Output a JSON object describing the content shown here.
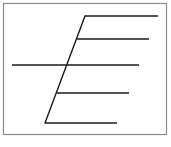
{
  "diagram": {
    "frame": {
      "x": 3.5,
      "y": 3.5,
      "width": 163,
      "height": 131,
      "stroke": "#8a8a8a",
      "stroke_width": 1.2
    },
    "stroke_color": "#1a1a1a",
    "stroke_width": 1.4,
    "spine": {
      "x1": 85,
      "y1": 16,
      "x2": 45,
      "y2": 123
    },
    "lines": [
      {
        "x1": 85,
        "y1": 16,
        "x2": 158,
        "y2": 16
      },
      {
        "x1": 77,
        "y1": 39,
        "x2": 149,
        "y2": 39
      },
      {
        "x1": 12,
        "y1": 65,
        "x2": 139,
        "y2": 65
      },
      {
        "x1": 57,
        "y1": 93,
        "x2": 129,
        "y2": 93
      },
      {
        "x1": 45,
        "y1": 123,
        "x2": 117,
        "y2": 123
      }
    ]
  }
}
